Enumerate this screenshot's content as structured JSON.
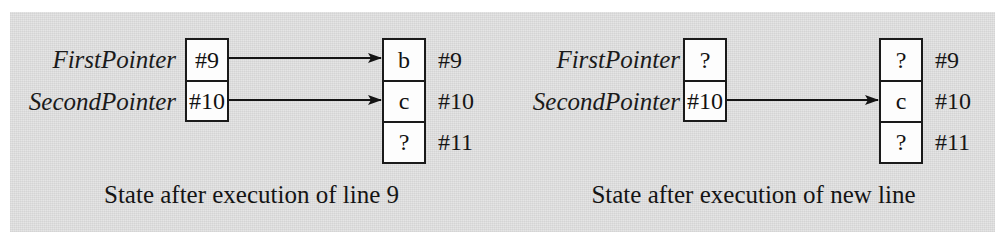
{
  "figure": {
    "background_color": "#e3e3e3",
    "ink_color": "#1a1a1a",
    "cell_fill": "#fdfdfd"
  },
  "panels": [
    {
      "id": "left",
      "caption": "State after execution of line 9",
      "pointer_variables": [
        {
          "name": "FirstPointer",
          "value": "#9"
        },
        {
          "name": "SecondPointer",
          "value": "#10"
        }
      ],
      "memory": {
        "cells": [
          {
            "value": "b",
            "address": "#9"
          },
          {
            "value": "c",
            "address": "#10"
          },
          {
            "value": "?",
            "address": "#11"
          }
        ]
      },
      "arrows": [
        {
          "from_variable": "FirstPointer",
          "to_address": "#9"
        },
        {
          "from_variable": "SecondPointer",
          "to_address": "#10"
        }
      ]
    },
    {
      "id": "right",
      "caption": "State after execution of new line",
      "pointer_variables": [
        {
          "name": "FirstPointer",
          "value": "?"
        },
        {
          "name": "SecondPointer",
          "value": "#10"
        }
      ],
      "memory": {
        "cells": [
          {
            "value": "?",
            "address": "#9"
          },
          {
            "value": "c",
            "address": "#10"
          },
          {
            "value": "?",
            "address": "#11"
          }
        ]
      },
      "arrows": [
        {
          "from_variable": "SecondPointer",
          "to_address": "#10"
        }
      ]
    }
  ]
}
